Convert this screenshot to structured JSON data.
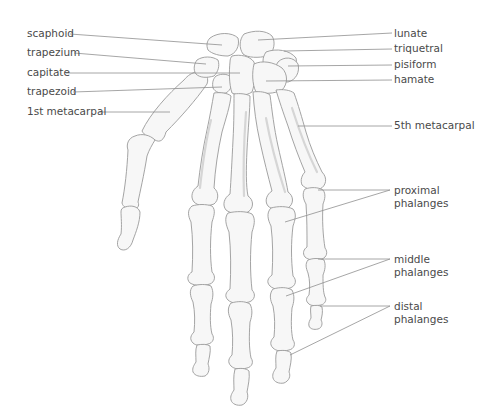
{
  "diagram": {
    "labels_left": [
      {
        "id": "scaphoid",
        "text": "scaphoid"
      },
      {
        "id": "trapezium",
        "text": "trapezium"
      },
      {
        "id": "capitate",
        "text": "capitate"
      },
      {
        "id": "trapezoid",
        "text": "trapezoid"
      },
      {
        "id": "first-metacarpal",
        "text": "1st metacarpal"
      }
    ],
    "labels_right": [
      {
        "id": "lunate",
        "text": "lunate"
      },
      {
        "id": "triquetral",
        "text": "triquetral"
      },
      {
        "id": "pisiform",
        "text": "pisiform"
      },
      {
        "id": "hamate",
        "text": "hamate"
      },
      {
        "id": "fifth-metacarpal",
        "text": "5th metacarpal"
      }
    ],
    "labels_phalanges": [
      {
        "id": "proximal-phalanges",
        "line1": "proximal",
        "line2": "phalanges"
      },
      {
        "id": "middle-phalanges",
        "line1": "middle",
        "line2": "phalanges"
      },
      {
        "id": "distal-phalanges",
        "line1": "distal",
        "line2": "phalanges"
      }
    ],
    "colors": {
      "bone_fill": "#f7f7f7",
      "bone_outline": "#9a9a9a",
      "leader_line": "#8f8f8f",
      "label_text": "#4a4a4a"
    }
  }
}
